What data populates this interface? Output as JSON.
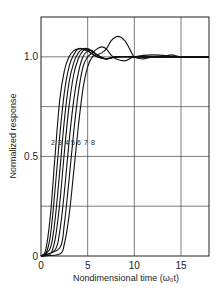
{
  "chart_data": {
    "type": "line",
    "title": "",
    "xlabel": "Nondimensional time (ω₀t)",
    "ylabel": "Normalized response",
    "xlim": [
      0,
      18
    ],
    "ylim": [
      0,
      1.2
    ],
    "xticks": [
      "0",
      "5",
      "10",
      "15"
    ],
    "yticks": [
      "0",
      "0.5",
      "1.0"
    ],
    "grid": true,
    "legend_position": "inline labels near y=0.6",
    "series": [
      {
        "name": "2",
        "x": [
          0,
          0.5,
          1,
          1.5,
          2,
          2.5,
          3,
          3.5,
          4,
          4.5,
          5,
          6,
          7,
          8,
          10,
          12,
          15,
          18
        ],
        "values": [
          0,
          0.03,
          0.2,
          0.5,
          0.78,
          0.93,
          1.0,
          1.03,
          1.04,
          1.04,
          1.03,
          1.0,
          0.99,
          1.0,
          1.0,
          1.0,
          1.0,
          1.0
        ]
      },
      {
        "name": "3",
        "x": [
          0,
          0.5,
          1,
          1.5,
          2,
          2.5,
          3,
          3.5,
          4,
          4.5,
          5,
          6,
          7,
          8,
          10,
          12,
          15,
          18
        ],
        "values": [
          0,
          0.01,
          0.1,
          0.33,
          0.6,
          0.82,
          0.95,
          1.01,
          1.04,
          1.04,
          1.03,
          1.0,
          0.99,
          1.0,
          1.0,
          1.0,
          1.0,
          1.0
        ]
      },
      {
        "name": "4",
        "x": [
          0,
          1,
          1.5,
          2,
          2.5,
          3,
          3.5,
          4,
          4.5,
          5,
          6,
          7,
          8,
          10,
          12,
          15,
          18
        ],
        "values": [
          0,
          0.04,
          0.18,
          0.42,
          0.68,
          0.87,
          0.97,
          1.02,
          1.04,
          1.04,
          1.01,
          0.99,
          1.0,
          1.0,
          1.0,
          1.0,
          1.0
        ]
      },
      {
        "name": "5",
        "x": [
          0,
          1,
          1.5,
          2,
          2.5,
          3,
          3.5,
          4,
          4.5,
          5,
          5.5,
          6,
          7,
          8,
          10,
          12,
          15,
          18
        ],
        "values": [
          0,
          0.01,
          0.08,
          0.26,
          0.52,
          0.75,
          0.91,
          0.99,
          1.03,
          1.04,
          1.03,
          1.01,
          0.99,
          1.0,
          1.0,
          1.0,
          1.0,
          1.0
        ]
      },
      {
        "name": "6",
        "x": [
          0,
          1.5,
          2,
          2.5,
          3,
          3.5,
          4,
          4.5,
          5,
          5.5,
          6,
          7,
          8,
          10,
          12,
          15,
          18
        ],
        "values": [
          0,
          0.03,
          0.12,
          0.32,
          0.57,
          0.78,
          0.92,
          1.0,
          1.03,
          1.03,
          1.01,
          0.99,
          1.0,
          1.0,
          1.0,
          1.0,
          1.0
        ]
      },
      {
        "name": "7",
        "x": [
          0,
          2,
          2.5,
          3,
          3.5,
          4,
          4.5,
          5,
          5.5,
          6,
          6.5,
          7,
          7.5,
          8,
          9,
          10,
          12,
          15,
          18
        ],
        "values": [
          0,
          0.04,
          0.16,
          0.38,
          0.62,
          0.82,
          0.95,
          1.0,
          1.02,
          1.04,
          1.05,
          1.04,
          1.01,
          0.99,
          0.98,
          1.0,
          1.01,
          1.0,
          1.0
        ]
      },
      {
        "name": "8",
        "x": [
          0,
          2,
          2.5,
          3,
          3.5,
          4,
          4.5,
          5,
          5.5,
          6,
          6.5,
          7,
          7.5,
          8,
          8.5,
          9,
          9.5,
          10,
          11,
          12,
          13,
          14,
          15,
          18
        ],
        "values": [
          0,
          0.01,
          0.06,
          0.2,
          0.42,
          0.65,
          0.84,
          0.95,
          1.0,
          1.01,
          1.02,
          1.04,
          1.08,
          1.1,
          1.1,
          1.08,
          1.04,
          1.0,
          0.99,
          1.0,
          1.0,
          1.01,
          1.0,
          1.0
        ]
      }
    ]
  }
}
